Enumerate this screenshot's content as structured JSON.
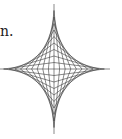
{
  "text_fragment": "n.",
  "figure": {
    "type": "string-art-astroid",
    "center": [
      54,
      69
    ],
    "radius_x": 56,
    "radius_y": 65,
    "divisions": 10,
    "stroke_color": "#3a3a3a"
  }
}
